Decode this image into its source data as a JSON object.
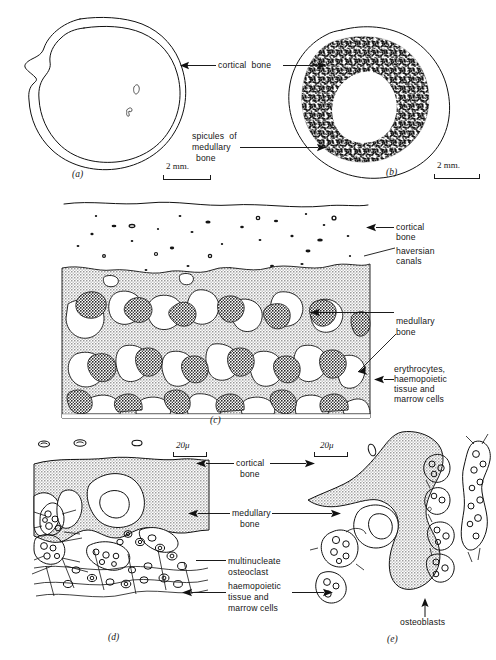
{
  "figure": {
    "panels": [
      {
        "id": "(a)",
        "scale_label": "2 mm."
      },
      {
        "id": "(b)",
        "scale_label": "2 mm."
      },
      {
        "id": "(c)"
      },
      {
        "id": "(d)",
        "scale_label": "20μ"
      },
      {
        "id": "(e)",
        "scale_label": "20μ"
      }
    ],
    "labels": {
      "cortical_bone_ab": "cortical  bone",
      "spicules_of": "spicules  of",
      "medullary": "medullary",
      "bone": "bone",
      "c_cortical": "cortical",
      "c_bone": "bone",
      "c_haversian": "haversian",
      "c_canals": "canals",
      "c_medullary": "medullary",
      "c_medullary_bone": "bone",
      "c_erythrocytes": "erythrocytes,",
      "c_haemopoietic": "haemopoietic",
      "c_tissue_and": "tissue and",
      "c_marrow_cells": "marrow cells",
      "d_cortical": "cortical",
      "d_cortical_bone": "bone",
      "d_medullary": "medullary",
      "d_medullary_bone": "bone",
      "d_multinucleate": "multinucleate",
      "d_osteoclast": "osteoclast",
      "d_haemopoietic": "haemopoietic",
      "d_tissue_and": "tissue and",
      "d_marrow_cells": "marrow cells",
      "e_osteoblasts": "osteoblasts"
    },
    "scales": {
      "mm": "2 mm.",
      "micron": "20μ"
    },
    "colors": {
      "ink": "#111111",
      "medullary_grey": "#b9b9b9",
      "page": "#ffffff"
    }
  }
}
